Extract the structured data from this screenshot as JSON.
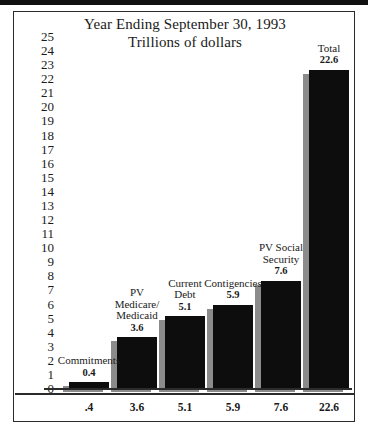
{
  "figure": {
    "title_line_1": "Year Ending September 30, 1993",
    "title_line_2": "Trillions of dollars"
  },
  "chart_data": {
    "type": "bar",
    "title": "Year Ending September 30, 1993",
    "subtitle": "Trillions of dollars",
    "xlabel": "",
    "ylabel": "Trillions of dollars",
    "ylim": [
      0,
      25
    ],
    "grid": false,
    "legend": "none",
    "categories": [
      "Commitments",
      "PV Medicare/ Medicaid",
      "Current Debt",
      "Contigencies",
      "PV Social Security",
      "Total"
    ],
    "values": [
      0.4,
      3.6,
      5.1,
      5.9,
      7.6,
      22.6
    ],
    "bar_labels": [
      {
        "name_lines": [
          "Commitments"
        ],
        "value": "0.4"
      },
      {
        "name_lines": [
          "PV",
          "Medicare/",
          "Medicaid"
        ],
        "value": "3.6"
      },
      {
        "name_lines": [
          "Current",
          "Debt"
        ],
        "value": "5.1"
      },
      {
        "name_lines": [
          "Contigencies"
        ],
        "value": "5.9"
      },
      {
        "name_lines": [
          "PV Social",
          "Security"
        ],
        "value": "7.6"
      },
      {
        "name_lines": [
          "Total"
        ],
        "value": "22.6"
      }
    ],
    "xtick_labels": [
      ".4",
      "3.6",
      "5.1",
      "5.9",
      "7.6",
      "22.6"
    ],
    "ytick_labels": [
      "25",
      "24",
      "23",
      "22",
      "21",
      "20",
      "19",
      "18",
      "17",
      "16",
      "15",
      "14",
      "13",
      "12",
      "11",
      "10",
      "9",
      "8",
      "7",
      "6",
      "5",
      "4",
      "3",
      "2",
      "1",
      "0"
    ],
    "colors": {
      "bar_fill": "#0d0d0d",
      "bar_shadow": "#8b8b8b",
      "axis": "#2b2b2b",
      "text": "#1a1a1a",
      "background": "#ffffff"
    }
  }
}
